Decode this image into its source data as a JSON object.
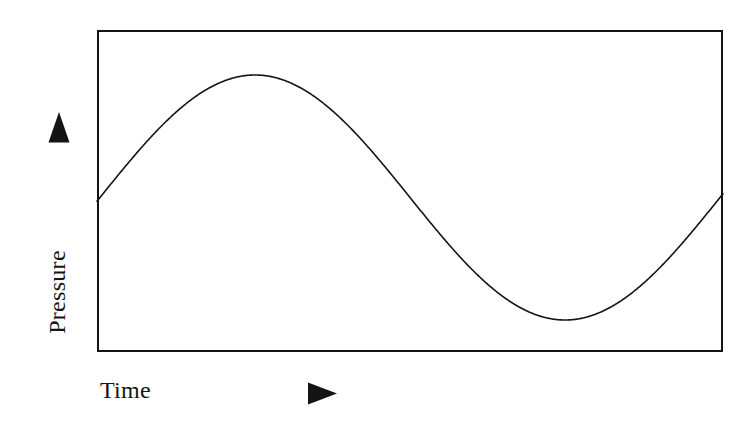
{
  "figure": {
    "background_color": "#ffffff",
    "ink_color": "#141414",
    "width": 746,
    "height": 430
  },
  "axes": {
    "y": {
      "label": "Pressure",
      "arrow_icon": "triangle-up-icon",
      "arrow_direction": "up"
    },
    "x": {
      "label": "Time",
      "arrow_icon": "triangle-right-icon",
      "arrow_direction": "right"
    },
    "frame": {
      "left": 97,
      "top": 30,
      "right": 723,
      "bottom": 352,
      "border_width": 2.5,
      "border_color": "#141414"
    }
  },
  "chart_data": {
    "type": "line",
    "title": "",
    "subtitle": "",
    "xlabel": "Time",
    "ylabel": "Pressure",
    "grid": false,
    "legend": null,
    "axis_ticks": {
      "x": [],
      "y": []
    },
    "series": [
      {
        "name": "Pressure",
        "color": "#141414",
        "line_width": 1.6,
        "waveform": "sinusoid",
        "description": "Smooth sine wave: rises from mid-level at left edge to a crest, falls through mid-level to a trough, then rises again toward the right edge.",
        "midline_y_px": 197.5,
        "amplitude_px": 122.5,
        "period_px": 620,
        "crest_x_px": 255,
        "trough_x_px": 565,
        "x": [
          97,
          120,
          150,
          180,
          210,
          240,
          255,
          270,
          300,
          330,
          360,
          390,
          410,
          440,
          470,
          500,
          530,
          560,
          565,
          580,
          610,
          640,
          670,
          700,
          723
        ],
        "y": [
          200.1,
          177.5,
          155.4,
          126.0,
          100.7,
          81.4,
          75.0,
          79.0,
          96.3,
          123.0,
          149.5,
          179.5,
          198.0,
          238.2,
          265.9,
          288.4,
          307.9,
          319.2,
          320.0,
          319.5,
          307.9,
          285.6,
          257.2,
          228.3,
          206.4
        ]
      }
    ]
  }
}
